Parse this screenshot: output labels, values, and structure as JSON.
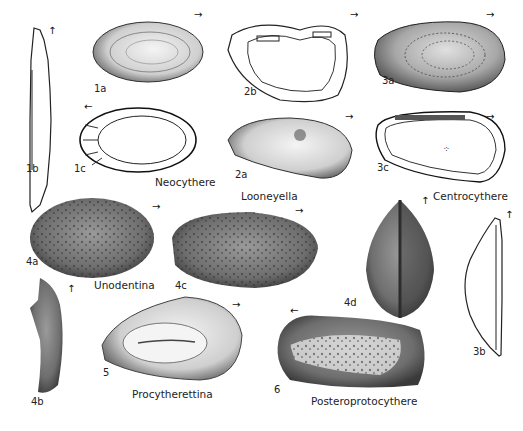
{
  "plate": {
    "specimens": [
      {
        "id": "1a",
        "genus": "Neocythere"
      },
      {
        "id": "1b",
        "genus": "Neocythere"
      },
      {
        "id": "1c",
        "genus": "Neocythere"
      },
      {
        "id": "2a",
        "genus": "Looneyella"
      },
      {
        "id": "2b",
        "genus": "Looneyella"
      },
      {
        "id": "3a",
        "genus": "Centrocythere"
      },
      {
        "id": "3b",
        "genus": "Centrocythere"
      },
      {
        "id": "3c",
        "genus": "Centrocythere"
      },
      {
        "id": "4a",
        "genus": "Unodentina"
      },
      {
        "id": "4b",
        "genus": "Unodentina"
      },
      {
        "id": "4c",
        "genus": "Unodentina"
      },
      {
        "id": "4d",
        "genus": "Unodentina"
      },
      {
        "id": "5",
        "genus": "Procytherettina"
      },
      {
        "id": "6",
        "genus": "Posteroprotocythere"
      }
    ],
    "genus_labels": {
      "neocythere": "Neocythere",
      "looneyella": "Looneyella",
      "centrocythere": "Centrocythere",
      "unodentina": "Unodentina",
      "procytherettina": "Procytherettina",
      "posteroprotocythere": "Posteroprotocythere"
    },
    "figure_labels": {
      "f1a": "1a",
      "f1b": "1b",
      "f1c": "1c",
      "f2a": "2a",
      "f2b": "2b",
      "f3a": "3a",
      "f3b": "3b",
      "f3c": "3c",
      "f4a": "4a",
      "f4b": "4b",
      "f4c": "4c",
      "f4d": "4d",
      "f5": "5",
      "f6": "6"
    },
    "arrows": {
      "right": "→",
      "left": "←",
      "up": "↑"
    }
  }
}
